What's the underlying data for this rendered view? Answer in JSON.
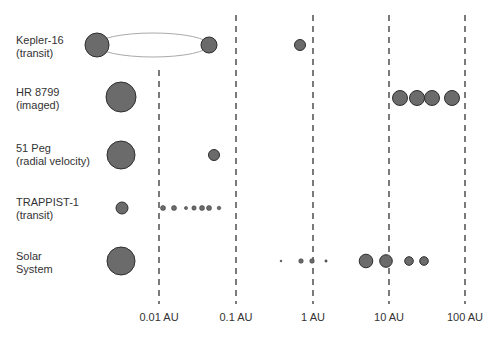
{
  "systems": [
    {
      "name": "Kepler-16",
      "method": "(transit)",
      "label_y": 34,
      "row_y": 45
    },
    {
      "name": "HR 8799",
      "method": "(imaged)",
      "label_y": 86,
      "row_y": 97
    },
    {
      "name": "51 Peg",
      "method": "(radial velocity)",
      "label_y": 142,
      "row_y": 154
    },
    {
      "name": "TRAPPIST-1",
      "method": "(transit)",
      "label_y": 196,
      "row_y": 208
    },
    {
      "name": "Solar",
      "method": "System",
      "label_y": 250,
      "row_y": 262
    }
  ],
  "axis": {
    "ticks": [
      {
        "label": "0.01 AU",
        "x": 159,
        "y_top": 70
      },
      {
        "label": "0.1 AU",
        "x": 236,
        "y_top": 15
      },
      {
        "label": "1 AU",
        "x": 313,
        "y_top": 15
      },
      {
        "label": "10 AU",
        "x": 389,
        "y_top": 15
      },
      {
        "label": "100 AU",
        "x": 465,
        "y_top": 15
      }
    ],
    "y_bottom": 304
  },
  "colors": {
    "body_fill": "#6b6b6b",
    "body_stroke": "#2e2e2e",
    "orbit": "#aaaaaa",
    "dash": "#333333",
    "text": "#333333"
  },
  "bodies": [
    {
      "system": "Kepler-16",
      "type": "star",
      "x": 97,
      "y": 45,
      "r": 12
    },
    {
      "system": "Kepler-16",
      "type": "star",
      "x": 209,
      "y": 45,
      "r": 8
    },
    {
      "system": "Kepler-16",
      "type": "planet",
      "x": 300,
      "y": 45,
      "r": 5.5
    },
    {
      "system": "HR 8799",
      "type": "star",
      "x": 121,
      "y": 97,
      "r": 15
    },
    {
      "system": "HR 8799",
      "type": "planet",
      "x": 400,
      "y": 98,
      "r": 7.5
    },
    {
      "system": "HR 8799",
      "type": "planet",
      "x": 417,
      "y": 98,
      "r": 7.5
    },
    {
      "system": "HR 8799",
      "type": "planet",
      "x": 432,
      "y": 98,
      "r": 7.5
    },
    {
      "system": "HR 8799",
      "type": "planet",
      "x": 452,
      "y": 98,
      "r": 7.5
    },
    {
      "system": "51 Peg",
      "type": "star",
      "x": 121,
      "y": 155,
      "r": 14
    },
    {
      "system": "51 Peg",
      "type": "planet",
      "x": 214,
      "y": 155,
      "r": 5.5
    },
    {
      "system": "TRAPPIST-1",
      "type": "star",
      "x": 122,
      "y": 208,
      "r": 6
    },
    {
      "system": "TRAPPIST-1",
      "type": "planet",
      "x": 163,
      "y": 208,
      "r": 2.5
    },
    {
      "system": "TRAPPIST-1",
      "type": "planet",
      "x": 174,
      "y": 208,
      "r": 2.5
    },
    {
      "system": "TRAPPIST-1",
      "type": "planet",
      "x": 186,
      "y": 208,
      "r": 1.6
    },
    {
      "system": "TRAPPIST-1",
      "type": "planet",
      "x": 194,
      "y": 208,
      "r": 2.2
    },
    {
      "system": "TRAPPIST-1",
      "type": "planet",
      "x": 202,
      "y": 208,
      "r": 2.5
    },
    {
      "system": "TRAPPIST-1",
      "type": "planet",
      "x": 209,
      "y": 208,
      "r": 2.5
    },
    {
      "system": "TRAPPIST-1",
      "type": "planet",
      "x": 219,
      "y": 208,
      "r": 1.8
    },
    {
      "system": "Solar System",
      "type": "star",
      "x": 121,
      "y": 261,
      "r": 14
    },
    {
      "system": "Solar System",
      "type": "planet",
      "name": "Mercury",
      "x": 281,
      "y": 261,
      "r": 0.9
    },
    {
      "system": "Solar System",
      "type": "planet",
      "name": "Venus",
      "x": 301,
      "y": 261,
      "r": 2.3
    },
    {
      "system": "Solar System",
      "type": "planet",
      "name": "Earth",
      "x": 312,
      "y": 261,
      "r": 2.3
    },
    {
      "system": "Solar System",
      "type": "planet",
      "name": "Mars",
      "x": 326,
      "y": 261,
      "r": 1.2
    },
    {
      "system": "Solar System",
      "type": "planet",
      "name": "Jupiter",
      "x": 366,
      "y": 261,
      "r": 6.8
    },
    {
      "system": "Solar System",
      "type": "planet",
      "name": "Saturn",
      "x": 386,
      "y": 261,
      "r": 6.3
    },
    {
      "system": "Solar System",
      "type": "planet",
      "name": "Uranus",
      "x": 409,
      "y": 261,
      "r": 4.3
    },
    {
      "system": "Solar System",
      "type": "planet",
      "name": "Neptune",
      "x": 424,
      "y": 261,
      "r": 4.3
    }
  ],
  "orbits": [
    {
      "system": "Kepler-16",
      "cx": 153,
      "cy": 45,
      "rx": 56,
      "ry": 12
    }
  ]
}
